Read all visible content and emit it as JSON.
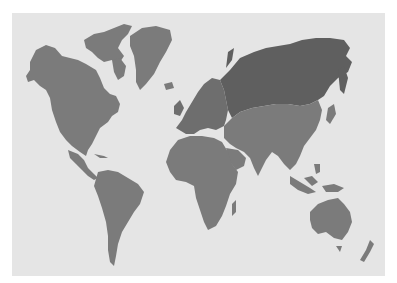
{
  "map": {
    "type": "world-map",
    "projection": "Miller",
    "background_color": "#ffffff",
    "ocean_color": "#e5e5e5",
    "land_color": "#7b7b7b",
    "highlight_color": "#5f5f5f",
    "highlighted_region": "Russia",
    "regions": [
      "North America",
      "Greenland",
      "South America",
      "Europe",
      "Africa",
      "Russia",
      "Asia",
      "Australia",
      "New Zealand"
    ]
  }
}
